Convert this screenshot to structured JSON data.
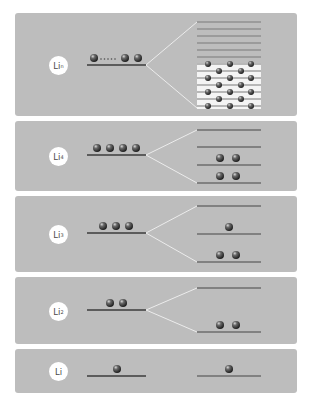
{
  "diagram": {
    "colors": {
      "background": "#ffffff",
      "panel": "#bdbdbd",
      "level_line": "#3d3d3d",
      "split_level_line": "#6e6e6e",
      "fan_line": "#eeeeee",
      "band_stripe": "#f4f4f4",
      "ball_dark": "#2e2e2e",
      "ball_light": "#bcbcbc"
    },
    "panels": [
      {
        "id": "lin",
        "label_base": "Li",
        "label_sub": "n",
        "top": 13,
        "height": 103,
        "left_level_y": 65,
        "left_balls": 4,
        "left_ball_note": "• • • • •  (ellipsis between first and last two)",
        "right_levels_y": [
          22,
          29,
          36,
          43,
          50,
          57,
          64,
          71,
          78,
          85,
          92,
          99,
          106
        ],
        "band": true
      },
      {
        "id": "li4",
        "label_base": "Li",
        "label_sub": "4",
        "top": 121,
        "height": 70,
        "left_level_y": 155,
        "left_balls": 4,
        "right_levels_y": [
          130,
          147,
          165,
          183
        ],
        "right_ball_counts": [
          0,
          0,
          2,
          2
        ]
      },
      {
        "id": "li3",
        "label_base": "Li",
        "label_sub": "3",
        "top": 196,
        "height": 76,
        "left_level_y": 233,
        "left_balls": 3,
        "right_levels_y": [
          206,
          234,
          262
        ],
        "right_ball_counts": [
          0,
          1,
          2
        ]
      },
      {
        "id": "li2",
        "label_base": "Li",
        "label_sub": "2",
        "top": 277,
        "height": 67,
        "left_level_y": 310,
        "left_balls": 2,
        "right_levels_y": [
          288,
          332
        ],
        "right_ball_counts": [
          0,
          2
        ]
      },
      {
        "id": "li",
        "label_base": "Li",
        "label_sub": "",
        "top": 349,
        "height": 44,
        "left_level_y": 376,
        "left_balls": 1,
        "right_levels_y": [
          376
        ],
        "right_ball_counts": [
          1
        ]
      }
    ]
  }
}
